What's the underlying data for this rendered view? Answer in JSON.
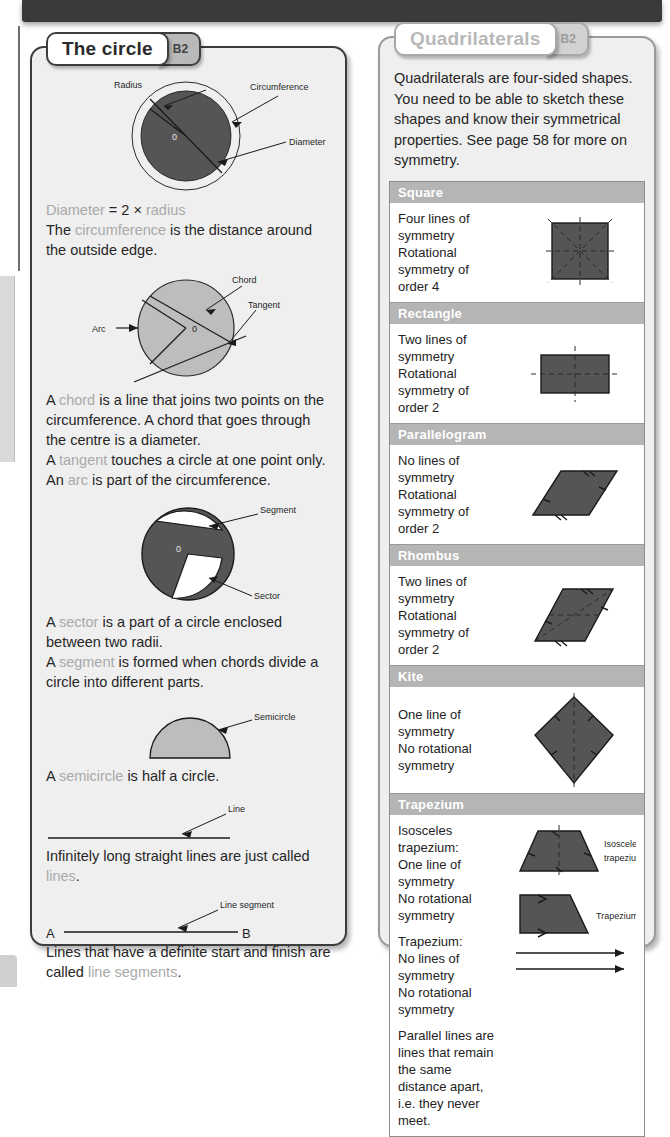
{
  "page": {
    "background_color": "#ffffff",
    "banner_color": "#3a3a3a",
    "panel_fill": "#efefef",
    "keyword_color": "#a9a9a9",
    "shape_fill": "#555555",
    "header_band_color": "#b5b5b5"
  },
  "left_panel": {
    "title": "The circle",
    "badge": "B2",
    "fig1": {
      "labels": {
        "radius": "Radius",
        "circumference": "Circumference",
        "diameter": "Diameter",
        "centre": "0"
      }
    },
    "text1_prefix": "Diameter = 2 × radius",
    "text1_a": "Diameter",
    "text1_b": " = 2 × ",
    "text1_c": "radius",
    "text2_a": "The ",
    "text2_kw": "circumference",
    "text2_b": " is the distance around the outside edge.",
    "fig2": {
      "labels": {
        "chord": "Chord",
        "tangent": "Tangent",
        "arc": "Arc",
        "centre": "0"
      }
    },
    "text3_a": "A ",
    "text3_kw": "chord",
    "text3_b": " is a line that joins two points on the circumference. A chord that goes through the centre is a diameter.",
    "text4_a": "A ",
    "text4_kw": "tangent",
    "text4_b": " touches a circle at one point only.",
    "text5_a": "An ",
    "text5_kw": "arc",
    "text5_b": " is part of the circumference.",
    "fig3": {
      "labels": {
        "segment": "Segment",
        "sector": "Sector",
        "centre": "0"
      }
    },
    "text6_a": "A ",
    "text6_kw": "sector",
    "text6_b": " is a part of a circle enclosed between two radii.",
    "text7_a": "A ",
    "text7_kw": "segment",
    "text7_b": " is formed when chords divide a circle into different parts.",
    "fig4": {
      "labels": {
        "semicircle": "Semicircle"
      }
    },
    "text8_a": "A ",
    "text8_kw": "semicircle",
    "text8_b": " is half a circle.",
    "fig5": {
      "labels": {
        "line": "Line"
      }
    },
    "text9_a": "Infinitely long straight lines are just called ",
    "text9_kw": "lines",
    "text9_b": ".",
    "fig6": {
      "labels": {
        "line_segment": "Line segment",
        "point_a": "A",
        "point_b": "B"
      }
    },
    "text10_a": "Lines that have a definite start and finish are called ",
    "text10_kw": "line segments",
    "text10_b": "."
  },
  "right_panel": {
    "title": "Quadrilaterals",
    "badge": "B2",
    "intro": "Quadrilaterals are four-sided shapes. You need to be able to sketch these shapes and know their symmetrical properties. See page 58 for more on symmetry.",
    "shapes": [
      {
        "name": "Square",
        "lines": [
          "Four lines of symmetry",
          "Rotational symmetry of order 4"
        ],
        "icon": "square-shape"
      },
      {
        "name": "Rectangle",
        "lines": [
          "Two lines of symmetry",
          "Rotational symmetry of order 2"
        ],
        "icon": "rectangle-shape"
      },
      {
        "name": "Parallelogram",
        "lines": [
          "No lines of symmetry",
          "Rotational symmetry of order 2"
        ],
        "icon": "parallelogram-shape"
      },
      {
        "name": "Rhombus",
        "lines": [
          "Two lines of symmetry",
          "Rotational symmetry of order 2"
        ],
        "icon": "rhombus-shape"
      },
      {
        "name": "Kite",
        "lines": [
          "One line of symmetry",
          "No rotational symmetry"
        ],
        "icon": "kite-shape"
      }
    ],
    "trapezium": {
      "name": "Trapezium",
      "isosceles_lines": [
        "Isosceles trapezium:",
        "One line of symmetry",
        "No rotational symmetry"
      ],
      "plain_lines": [
        "Trapezium:",
        "No lines of symmetry",
        "No rotational symmetry"
      ],
      "parallel_note": "Parallel lines are lines that remain the same distance apart, i.e. they never meet.",
      "label_isosceles_1": "Isosceles",
      "label_isosceles_2": "trapezium",
      "label_trapezium": "Trapezium"
    }
  }
}
